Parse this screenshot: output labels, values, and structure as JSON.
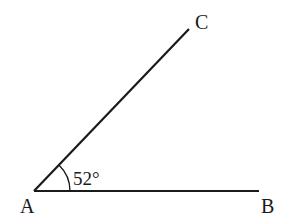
{
  "diagram": {
    "type": "angle",
    "stroke_color": "#1a1a1a",
    "vertices": {
      "A": {
        "label": "A",
        "x": 34,
        "y": 191
      },
      "B": {
        "label": "B",
        "x": 259,
        "y": 191
      },
      "C": {
        "label": "C",
        "x": 189,
        "y": 29
      }
    },
    "segments": [
      {
        "from": "A",
        "to": "B"
      },
      {
        "from": "A",
        "to": "C"
      }
    ],
    "angle": {
      "at": "A",
      "between": [
        "B",
        "C"
      ],
      "label": "52°",
      "value_degrees": 52,
      "arc_radius": 36
    }
  }
}
